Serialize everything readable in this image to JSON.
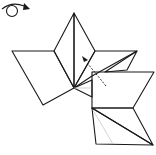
{
  "diagram": {
    "type": "origami-fold-step",
    "symbols": {
      "rotate": {
        "icon": "turn-over-icon",
        "meaning": "turn model over"
      },
      "fold_arrow": {
        "icon": "fold-arrow-icon",
        "meaning": "fold flap in direction of arrow"
      }
    },
    "colors": {
      "dark_side": "#a8a8a8",
      "light_side": "#dcdcdc",
      "white_side": "#ffffff",
      "edge": "#1a1a1a",
      "crease": "#c8c8c8"
    }
  }
}
